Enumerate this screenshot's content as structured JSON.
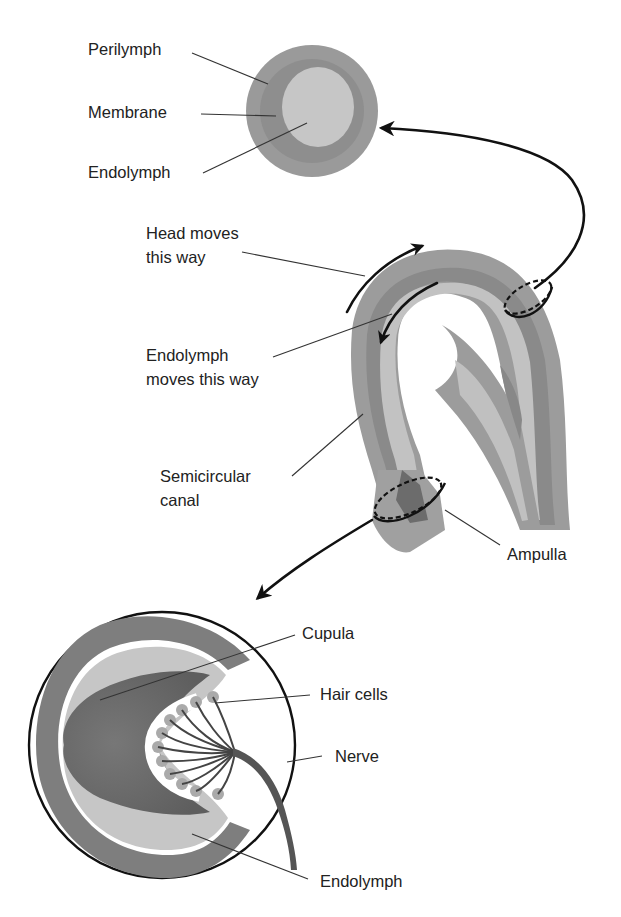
{
  "figure": {
    "colors": {
      "background": "#ffffff",
      "perilymph_outer": "#9a9a9a",
      "membrane": "#8c8c8c",
      "endolymph_light": "#c4c4c4",
      "cupula_dark": "#6e6e6e",
      "hair_cells": "#a8a8a8",
      "line": "#111111",
      "text": "#222222"
    }
  },
  "cross_section": {
    "labels": {
      "perilymph": "Perilymph",
      "membrane": "Membrane",
      "endolymph": "Endolymph"
    }
  },
  "canal": {
    "labels": {
      "head_moves_line1": "Head moves",
      "head_moves_line2": "this way",
      "endolymph_moves_line1": "Endolymph",
      "endolymph_moves_line2": "moves this way",
      "semicircular_line1": "Semicircular",
      "semicircular_line2": "canal",
      "ampulla": "Ampulla"
    }
  },
  "ampulla_detail": {
    "labels": {
      "cupula": "Cupula",
      "hair_cells": "Hair cells",
      "nerve": "Nerve",
      "endolymph": "Endolymph"
    }
  }
}
